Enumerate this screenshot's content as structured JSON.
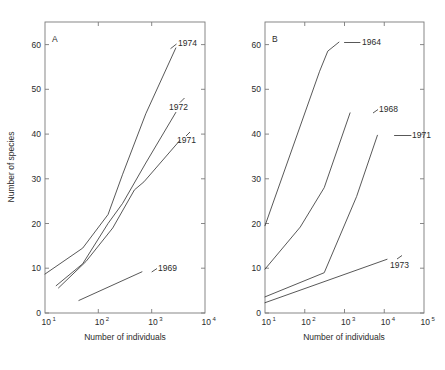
{
  "figure": {
    "background": "#ffffff",
    "line_color": "#3a3a3a",
    "axis_color": "#7a7a7a",
    "width": 445,
    "height": 370
  },
  "chart_data": [
    {
      "type": "line",
      "panel": "A",
      "panel_label": "A",
      "title": "",
      "xlabel": "Number of individuals",
      "ylabel": "Number of species",
      "xscale": "log",
      "yscale": "linear",
      "xlim": [
        10,
        20000
      ],
      "ylim": [
        0,
        65
      ],
      "grid": false,
      "legend": "inline-end-labels",
      "xticks": [
        10,
        100,
        1000,
        10000
      ],
      "xtick_labels": [
        "10^1",
        "10^2",
        "10^3",
        "10^4"
      ],
      "yticks": [
        0,
        10,
        20,
        30,
        40,
        50,
        60
      ],
      "ytick_labels": [
        "0",
        "10",
        "20",
        "30",
        "40",
        "50",
        "60"
      ],
      "series": [
        {
          "name": "1974",
          "label": "1974",
          "x": [
            10,
            60,
            200,
            400,
            1200,
            5000
          ],
          "y": [
            8.7,
            14.5,
            22.0,
            31.0,
            44.5,
            59.2
          ]
        },
        {
          "name": "1972",
          "label": "1972",
          "x": [
            17,
            60,
            200,
            400,
            1200,
            5000
          ],
          "y": [
            6.1,
            11.0,
            20.0,
            24.5,
            33.5,
            44.8
          ]
        },
        {
          "name": "1971",
          "label": "1971",
          "x": [
            19,
            70,
            250,
            700,
            1100,
            6000
          ],
          "y": [
            5.6,
            11.5,
            19.0,
            27.5,
            29.3,
            38.5
          ]
        },
        {
          "name": "1969",
          "label": "1969",
          "x": [
            50,
            1000
          ],
          "y": [
            2.8,
            9.2
          ]
        }
      ]
    },
    {
      "type": "line",
      "panel": "B",
      "panel_label": "B",
      "title": "",
      "xlabel": "Number of individuals",
      "ylabel": "Number of species",
      "xscale": "log",
      "yscale": "linear",
      "xlim": [
        10,
        200000
      ],
      "ylim": [
        0,
        65
      ],
      "grid": false,
      "legend": "inline-end-labels",
      "xticks": [
        10,
        100,
        1000,
        10000,
        100000
      ],
      "xtick_labels": [
        "10^1",
        "10^2",
        "10^3",
        "10^4",
        "10^5"
      ],
      "yticks": [
        0,
        10,
        20,
        30,
        40,
        50,
        60
      ],
      "ytick_labels": [
        "0",
        "10",
        "20",
        "30",
        "40",
        "50",
        "60"
      ],
      "series": [
        {
          "name": "1964",
          "label": "1964",
          "x": [
            10,
            300,
            500,
            1000
          ],
          "y": [
            19.5,
            54.0,
            58.5,
            60.5
          ]
        },
        {
          "name": "1968",
          "label": "1968",
          "x": [
            10,
            90,
            400,
            2000
          ],
          "y": [
            9.8,
            19.2,
            28.0,
            44.7
          ]
        },
        {
          "name": "1971",
          "label": "1971",
          "x": [
            10,
            400,
            3000,
            11000
          ],
          "y": [
            3.6,
            9.0,
            26.0,
            39.7
          ]
        },
        {
          "name": "1973",
          "label": "1973",
          "x": [
            10,
            20000
          ],
          "y": [
            2.3,
            12.0
          ]
        }
      ]
    }
  ],
  "panelA": {
    "letter": "A",
    "xlabel": "Number of individuals",
    "ylabel": "Number of species",
    "xtick_base": "10",
    "xtick_exponents": [
      "1",
      "2",
      "3",
      "4"
    ],
    "ytick_labels": [
      "0",
      "10",
      "20",
      "30",
      "40",
      "50",
      "60"
    ],
    "series_labels": [
      "1974",
      "1972",
      "1971",
      "1969"
    ]
  },
  "panelB": {
    "letter": "B",
    "xlabel": "Number of individuals",
    "xtick_base": "10",
    "xtick_exponents": [
      "1",
      "2",
      "3",
      "4",
      "5"
    ],
    "ytick_labels": [
      "0",
      "10",
      "20",
      "30",
      "40",
      "50",
      "60"
    ],
    "series_labels": [
      "1964",
      "1968",
      "1971",
      "1973"
    ]
  }
}
